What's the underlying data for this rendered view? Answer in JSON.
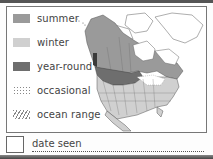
{
  "legend": {
    "items": [
      {
        "label": "summer",
        "pattern": "solid",
        "color": "#9a9a9a"
      },
      {
        "label": "winter",
        "pattern": "solid",
        "color": "#d0d0d0"
      },
      {
        "label": "year-round",
        "pattern": "solid",
        "color": "#6e6e6e"
      },
      {
        "label": "occasional",
        "pattern": "dotted",
        "color": "#888888"
      },
      {
        "label": "ocean range",
        "pattern": "hatched",
        "color": "#888888"
      }
    ]
  },
  "map": {
    "region": "North America",
    "colors": {
      "summer": "#9a9a9a",
      "winter": "#d0d0d0",
      "year_round": "#6e6e6e",
      "outline": "#555555",
      "background": "#ffffff"
    }
  },
  "date_seen": {
    "label": "date seen",
    "value": ""
  }
}
